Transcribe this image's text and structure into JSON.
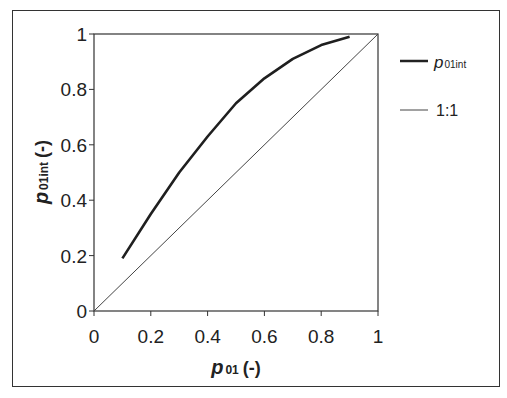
{
  "chart_data": {
    "type": "line",
    "title": "",
    "xlabel": "p01 (-)",
    "ylabel": "p01int (-)",
    "xlim": [
      0,
      1
    ],
    "ylim": [
      0,
      1
    ],
    "x_ticks": [
      "0",
      "0.2",
      "0.4",
      "0.6",
      "0.8",
      "1"
    ],
    "y_ticks": [
      "0",
      "0.2",
      "0.4",
      "0.6",
      "0.8",
      "1"
    ],
    "grid": false,
    "legend_position": "right",
    "series": [
      {
        "name": "p01int",
        "style": "thick solid",
        "x": [
          0.1,
          0.2,
          0.3,
          0.4,
          0.5,
          0.6,
          0.7,
          0.8,
          0.9
        ],
        "y": [
          0.19,
          0.35,
          0.5,
          0.63,
          0.75,
          0.84,
          0.91,
          0.96,
          0.99
        ]
      },
      {
        "name": "1:1",
        "style": "thin solid",
        "x": [
          0,
          1
        ],
        "y": [
          0,
          1
        ]
      }
    ]
  },
  "axes": {
    "xlabel_main": "p",
    "xlabel_sub": "01",
    "xlabel_unit": "(-)",
    "ylabel_main": "p",
    "ylabel_sub": "01int",
    "ylabel_unit": "(-)"
  },
  "legend": {
    "item1_main": "p",
    "item1_sub": "01int",
    "item2": "1:1"
  }
}
